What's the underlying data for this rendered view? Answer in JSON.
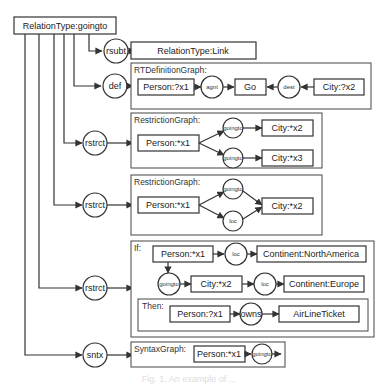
{
  "root": {
    "label": "RelationType:goingto"
  },
  "branches": [
    {
      "relation": "rsubt",
      "target": "RelationType:Link"
    },
    {
      "relation": "def",
      "graph_title": "RTDefinitionGraph:",
      "nodes": {
        "a": "Person:?x1",
        "r1": "agnt",
        "b": "Go",
        "r2": "dest",
        "c": "City:?x2"
      }
    },
    {
      "relation": "rstrct",
      "graph_title": "RestrictionGraph:",
      "nodes": {
        "a": "Person:*x1",
        "r1": "goingto",
        "b": "City:*x2",
        "r2": "goingto",
        "c": "City:*x3"
      }
    },
    {
      "relation": "rstrct",
      "graph_title": "RestrictionGraph:",
      "nodes": {
        "a": "Person:*x1",
        "r1": "goingto",
        "r2": "loc",
        "b": "City:*x2"
      }
    },
    {
      "relation": "rstrct",
      "if_title": "If:",
      "if_nodes": {
        "a": "Person:*x1",
        "r1": "loc",
        "b": "Continent:NorthAmerica",
        "r2": "goingto",
        "c": "City:*x2",
        "r3": "loc",
        "d": "Continent:Europe"
      },
      "then_title": "Then:",
      "then_nodes": {
        "a": "Person:?x1",
        "r1": "owns",
        "b": "AirLineTicket"
      }
    },
    {
      "relation": "sntx",
      "graph_title": "SyntaxGraph:",
      "nodes": {
        "a": "Person:*x1",
        "r1": "goingto",
        "b": "City:*x2"
      }
    }
  ],
  "caption": "Fig. 1. An example of ..."
}
